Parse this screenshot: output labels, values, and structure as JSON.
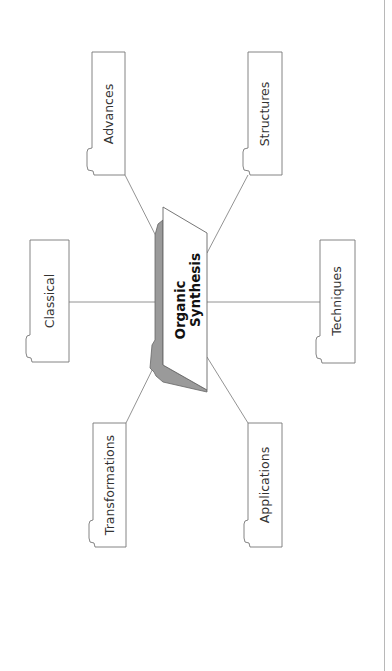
{
  "diagram": {
    "type": "mind-map",
    "orientation": "rotated -90deg",
    "center": {
      "line1": "Organic",
      "line2": "Synthesis"
    },
    "nodes": [
      {
        "id": "advances",
        "label": "Advances"
      },
      {
        "id": "structures",
        "label": "Structures"
      },
      {
        "id": "classical",
        "label": "Classical"
      },
      {
        "id": "techniques",
        "label": "Techniques"
      },
      {
        "id": "transformations",
        "label": "Transformations"
      },
      {
        "id": "applications",
        "label": "Applications"
      }
    ],
    "colors": {
      "stroke": "#777777",
      "shadow": "#9a9a9a",
      "text": "#333333",
      "center_text": "#111111"
    }
  }
}
